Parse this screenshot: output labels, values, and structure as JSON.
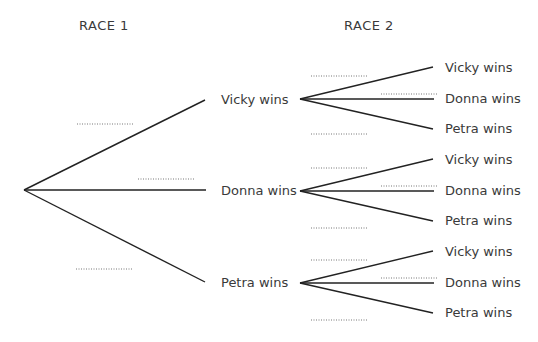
{
  "headers": {
    "race1": "RACE 1",
    "race2": "RACE 2"
  },
  "race1": {
    "branches": [
      {
        "label": "Vicky wins",
        "probability": "............"
      },
      {
        "label": "Donna wins",
        "probability": "............"
      },
      {
        "label": "Petra wins",
        "probability": "............"
      }
    ]
  },
  "race2": {
    "groups": [
      {
        "parent": "Vicky wins",
        "branches": [
          {
            "label": "Vicky wins",
            "probability": "............"
          },
          {
            "label": "Donna wins",
            "probability": "............"
          },
          {
            "label": "Petra wins",
            "probability": "............"
          }
        ]
      },
      {
        "parent": "Donna wins",
        "branches": [
          {
            "label": "Vicky wins",
            "probability": "............"
          },
          {
            "label": "Donna wins",
            "probability": "............"
          },
          {
            "label": "Petra wins",
            "probability": "............"
          }
        ]
      },
      {
        "parent": "Petra wins",
        "branches": [
          {
            "label": "Vicky wins",
            "probability": "............"
          },
          {
            "label": "Donna wins",
            "probability": "............"
          },
          {
            "label": "Petra wins",
            "probability": "............"
          }
        ]
      }
    ]
  },
  "colors": {
    "line": "#222222",
    "text": "#3a3a3a",
    "dots": "#777777"
  }
}
